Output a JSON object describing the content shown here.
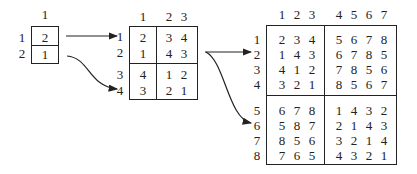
{
  "matrix_small": {
    "col_labels": [
      "1"
    ],
    "row_labels": [
      "1",
      "2"
    ],
    "rows": [
      [
        "2"
      ],
      [
        "1"
      ]
    ]
  },
  "matrix_medium": {
    "col_labels": [
      "1",
      "2",
      "3"
    ],
    "row_labels": [
      "1",
      "2",
      "3",
      "4"
    ],
    "rows": [
      [
        "2",
        "3",
        "4"
      ],
      [
        "1",
        "4",
        "3"
      ],
      [
        "4",
        "1",
        "2"
      ],
      [
        "3",
        "2",
        "1"
      ]
    ]
  },
  "matrix_large": {
    "col_labels": [
      "1",
      "2",
      "3",
      "4",
      "5",
      "6",
      "7"
    ],
    "row_labels": [
      "1",
      "2",
      "3",
      "4",
      "5",
      "6",
      "7",
      "8"
    ],
    "rows": [
      [
        "2",
        "3",
        "4",
        "5",
        "6",
        "7",
        "8"
      ],
      [
        "1",
        "4",
        "3",
        "6",
        "7",
        "8",
        "5"
      ],
      [
        "4",
        "1",
        "2",
        "7",
        "8",
        "5",
        "6"
      ],
      [
        "3",
        "2",
        "1",
        "8",
        "5",
        "6",
        "7"
      ],
      [
        "6",
        "7",
        "8",
        "1",
        "4",
        "3",
        "2"
      ],
      [
        "5",
        "8",
        "7",
        "2",
        "1",
        "4",
        "3"
      ],
      [
        "8",
        "5",
        "6",
        "3",
        "2",
        "1",
        "4"
      ],
      [
        "7",
        "6",
        "5",
        "4",
        "3",
        "2",
        "1"
      ]
    ]
  },
  "arrows": [
    {
      "from": "matrix_small",
      "to": "matrix_medium.row_1",
      "shape": "straight"
    },
    {
      "from": "matrix_small",
      "to": "matrix_medium.row_4",
      "shape": "curve"
    },
    {
      "from": "matrix_medium",
      "to": "matrix_large.row_2",
      "shape": "straight"
    },
    {
      "from": "matrix_medium",
      "to": "matrix_large.row_6",
      "shape": "curve"
    }
  ]
}
